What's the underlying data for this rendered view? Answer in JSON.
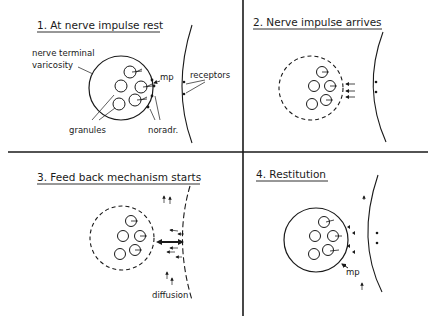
{
  "panels": [
    {
      "number": "1.",
      "title": "1. At nerve impulse rest",
      "labels": {
        "terminal_line1": "nerve terminal",
        "terminal_line2": "varicosity",
        "mp": "mp",
        "receptors": "receptors",
        "granules": "granules",
        "noradr": "noradr."
      }
    },
    {
      "number": "2.",
      "title": "2. Nerve impulse arrives"
    },
    {
      "number": "3.",
      "title": "3. Feed back mechanism starts",
      "labels": {
        "diffusion": "diffusion"
      }
    },
    {
      "number": "4.",
      "title": "4. Restitution",
      "labels": {
        "mp": "mp"
      }
    }
  ],
  "colors": {
    "ink": "#1a1a1a",
    "background": "#ffffff"
  }
}
